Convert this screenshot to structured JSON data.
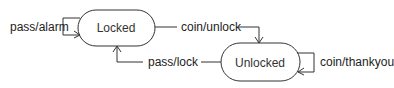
{
  "diagram": {
    "type": "state-machine",
    "states": [
      {
        "id": "locked",
        "label": "Locked"
      },
      {
        "id": "unlocked",
        "label": "Unlocked"
      }
    ],
    "transitions": [
      {
        "id": "pass-alarm",
        "from": "locked",
        "to": "locked",
        "label": "pass/alarm"
      },
      {
        "id": "coin-unlock",
        "from": "locked",
        "to": "unlocked",
        "label": "coin/unlock"
      },
      {
        "id": "pass-lock",
        "from": "unlocked",
        "to": "locked",
        "label": "pass/lock"
      },
      {
        "id": "coin-thankyou",
        "from": "unlocked",
        "to": "unlocked",
        "label": "coin/thankyou"
      }
    ],
    "colors": {
      "stroke": "#333333",
      "text": "#222222",
      "background": "#ffffff"
    }
  }
}
